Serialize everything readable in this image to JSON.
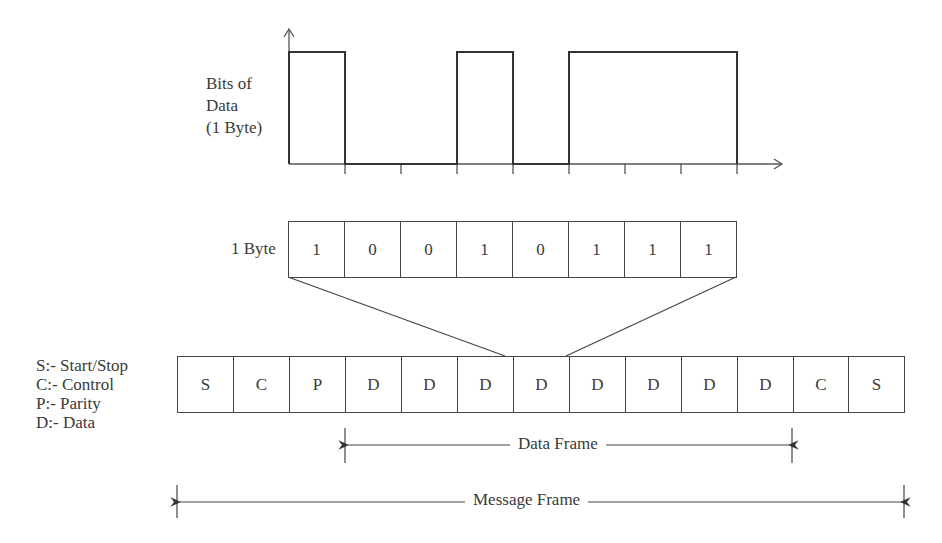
{
  "waveform": {
    "y_label_lines": [
      "Bits of",
      "Data",
      "(1 Byte)"
    ],
    "bits": [
      1,
      0,
      0,
      1,
      0,
      1,
      1,
      1
    ]
  },
  "byte": {
    "label": "1 Byte",
    "cells": [
      "1",
      "0",
      "0",
      "1",
      "0",
      "1",
      "1",
      "1"
    ]
  },
  "legend": {
    "items": [
      "S:- Start/Stop",
      "C:- Control",
      "P:- Parity",
      "D:- Data"
    ]
  },
  "message_frame": {
    "cells": [
      "S",
      "C",
      "P",
      "D",
      "D",
      "D",
      "D",
      "D",
      "D",
      "D",
      "D",
      "C",
      "S"
    ]
  },
  "dimensions": {
    "data_frame_label": "Data Frame",
    "message_frame_label": "Message Frame"
  },
  "colors": {
    "line": "#444444",
    "waveform": "#333333",
    "background": "#ffffff"
  }
}
